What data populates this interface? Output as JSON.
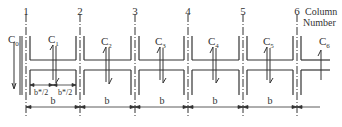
{
  "diagram": {
    "type": "multi-cell flow/structure plan",
    "legend": {
      "line1": "Column",
      "line2": "Number"
    },
    "columns": [
      {
        "number": "1",
        "x": 26
      },
      {
        "number": "2",
        "x": 80
      },
      {
        "number": "3",
        "x": 135
      },
      {
        "number": "4",
        "x": 188
      },
      {
        "number": "5",
        "x": 243
      },
      {
        "number": "6",
        "x": 297
      }
    ],
    "cells": [
      {
        "label": "C",
        "sub": "0"
      },
      {
        "label": "C",
        "sub": "1"
      },
      {
        "label": "C",
        "sub": "2"
      },
      {
        "label": "C",
        "sub": "3"
      },
      {
        "label": "C",
        "sub": "4"
      },
      {
        "label": "C",
        "sub": "5"
      },
      {
        "label": "C",
        "sub": "6"
      }
    ],
    "dimensions": {
      "span_label": "b",
      "half_span_label": "b*/2",
      "spans": [
        "b",
        "b",
        "b",
        "b",
        "b"
      ]
    },
    "colors": {
      "line": "#333333",
      "background": "#ffffff"
    }
  }
}
